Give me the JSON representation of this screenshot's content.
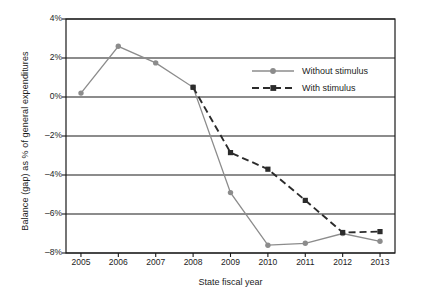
{
  "chart_data": {
    "type": "line",
    "title": "",
    "xlabel": "State fiscal year",
    "ylabel": "Balance (gap) as % of general expenditures",
    "categories": [
      "2005",
      "2006",
      "2007",
      "2008",
      "2009",
      "2010",
      "2011",
      "2012",
      "2013"
    ],
    "xlim": [
      2004.6,
      2013.4
    ],
    "ylim": [
      -8,
      4
    ],
    "yticks": [
      "4%",
      "2%",
      "0%",
      "-2%",
      "-4%",
      "-6%",
      "-8%"
    ],
    "ytick_values": [
      4,
      2,
      0,
      -2,
      -4,
      -6,
      -8
    ],
    "grid": "horizontal",
    "legend_position": "upper right",
    "series": [
      {
        "name": "Without stimulus",
        "color": "#8c8c8c",
        "marker": "circle",
        "linestyle": "solid",
        "x": [
          2005,
          2006,
          2007,
          2008,
          2009,
          2010,
          2011,
          2012,
          2013
        ],
        "values": [
          0.2,
          2.6,
          1.75,
          0.5,
          -4.9,
          -7.6,
          -7.5,
          -7.0,
          -7.4
        ]
      },
      {
        "name": "With stimulus",
        "color": "#2b2b2b",
        "marker": "square",
        "linestyle": "dashed",
        "x": [
          2008,
          2009,
          2010,
          2011,
          2012,
          2013
        ],
        "values": [
          0.5,
          -2.85,
          -3.7,
          -5.3,
          -6.95,
          -6.9
        ]
      }
    ]
  },
  "legend": {
    "items": [
      {
        "label": "Without stimulus"
      },
      {
        "label": "With stimulus"
      }
    ]
  }
}
